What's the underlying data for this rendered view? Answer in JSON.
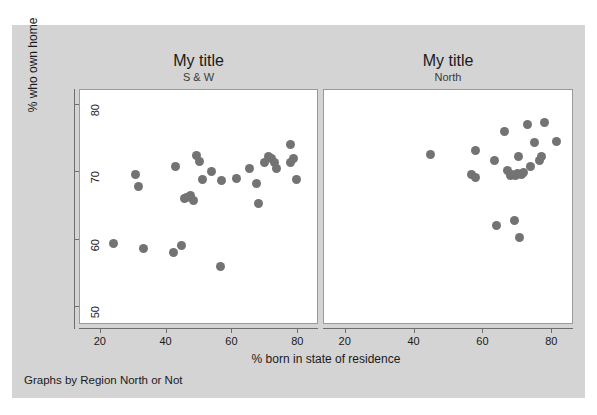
{
  "top_sliver_text": "",
  "graph": {
    "background_color": "#d4d4d4",
    "plot_background_color": "#ffffff",
    "marker_color": "#737373",
    "axis_color": "#6e6e6e",
    "note": "Graphs by Region North or Not",
    "xlabel": "% born in state of residence",
    "ylabel": "% who own home",
    "xticks": [
      "20",
      "40",
      "60",
      "80"
    ],
    "yticks": [
      "50",
      "60",
      "70",
      "80"
    ]
  },
  "chart_data": {
    "type": "scatter",
    "title": "My title",
    "xlabel": "% born in state of residence",
    "ylabel": "% who own home",
    "note": "Graphs by Region North or Not",
    "xlim": [
      14,
      86
    ],
    "ylim": [
      47.5,
      82
    ],
    "grid": false,
    "legend": "none",
    "panels": [
      {
        "title": "My title",
        "subtitle": "S & W",
        "xlim": [
          14,
          86
        ],
        "ylim": [
          47.5,
          82
        ],
        "xticks": [
          20,
          40,
          60,
          80
        ],
        "yticks": [
          50,
          60,
          70,
          80
        ],
        "points": [
          {
            "x": 24.1,
            "y": 59.3
          },
          {
            "x": 30.8,
            "y": 69.5
          },
          {
            "x": 31.8,
            "y": 67.7
          },
          {
            "x": 33.3,
            "y": 58.6
          },
          {
            "x": 42.5,
            "y": 57.9
          },
          {
            "x": 43.1,
            "y": 70.6
          },
          {
            "x": 44.8,
            "y": 59.0
          },
          {
            "x": 45.7,
            "y": 65.9
          },
          {
            "x": 46.4,
            "y": 66.1
          },
          {
            "x": 47.6,
            "y": 66.4
          },
          {
            "x": 48.6,
            "y": 65.7
          },
          {
            "x": 49.4,
            "y": 72.3
          },
          {
            "x": 50.2,
            "y": 71.4
          },
          {
            "x": 51.2,
            "y": 68.8
          },
          {
            "x": 54.0,
            "y": 70.0
          },
          {
            "x": 56.8,
            "y": 55.9
          },
          {
            "x": 57.1,
            "y": 68.6
          },
          {
            "x": 61.5,
            "y": 68.9
          },
          {
            "x": 65.6,
            "y": 70.4
          },
          {
            "x": 67.5,
            "y": 68.1
          },
          {
            "x": 68.3,
            "y": 65.2
          },
          {
            "x": 70.2,
            "y": 71.2
          },
          {
            "x": 71.4,
            "y": 72.2
          },
          {
            "x": 72.3,
            "y": 71.9
          },
          {
            "x": 73.0,
            "y": 71.3
          },
          {
            "x": 73.6,
            "y": 70.4
          },
          {
            "x": 77.8,
            "y": 71.2
          },
          {
            "x": 78.0,
            "y": 73.9
          },
          {
            "x": 78.9,
            "y": 71.8
          },
          {
            "x": 79.9,
            "y": 68.7
          }
        ]
      },
      {
        "title": "My title",
        "subtitle": "North",
        "xlim": [
          14,
          86
        ],
        "ylim": [
          47.5,
          82
        ],
        "xticks": [
          20,
          40,
          60,
          80
        ],
        "yticks": [
          50,
          60,
          70,
          80
        ],
        "points": [
          {
            "x": 44.9,
            "y": 72.5
          },
          {
            "x": 56.9,
            "y": 69.5
          },
          {
            "x": 57.9,
            "y": 69.1
          },
          {
            "x": 58.0,
            "y": 73.1
          },
          {
            "x": 63.4,
            "y": 71.6
          },
          {
            "x": 64.1,
            "y": 62.0
          },
          {
            "x": 66.3,
            "y": 75.8
          },
          {
            "x": 67.3,
            "y": 70.1
          },
          {
            "x": 68.0,
            "y": 69.4
          },
          {
            "x": 68.4,
            "y": 69.5
          },
          {
            "x": 69.2,
            "y": 62.7
          },
          {
            "x": 69.5,
            "y": 69.3
          },
          {
            "x": 70.2,
            "y": 69.6
          },
          {
            "x": 70.5,
            "y": 72.2
          },
          {
            "x": 70.7,
            "y": 60.1
          },
          {
            "x": 71.4,
            "y": 69.5
          },
          {
            "x": 72.0,
            "y": 69.8
          },
          {
            "x": 73.2,
            "y": 76.9
          },
          {
            "x": 74.0,
            "y": 70.7
          },
          {
            "x": 75.2,
            "y": 74.3
          },
          {
            "x": 76.5,
            "y": 71.5
          },
          {
            "x": 77.1,
            "y": 72.1
          },
          {
            "x": 78.0,
            "y": 77.2
          },
          {
            "x": 81.5,
            "y": 74.4
          }
        ]
      }
    ]
  }
}
